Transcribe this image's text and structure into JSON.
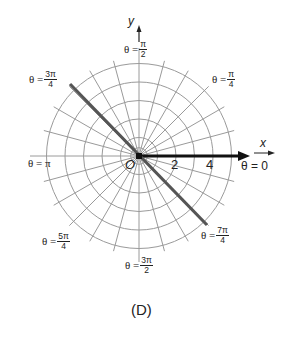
{
  "chart_data": {
    "type": "polar",
    "title": "",
    "caption": "(D)",
    "graph": "θ = 3π/4 (line through origin)",
    "rings": [
      1,
      2,
      3,
      4,
      5
    ],
    "spoke_step_deg": 15,
    "radial_tick_labels": [
      "2",
      "4"
    ],
    "origin_label": "O",
    "x_axis_label": "x",
    "y_axis_label": "y",
    "angle_labels": [
      {
        "name": "theta-0",
        "text": "θ = 0"
      },
      {
        "name": "theta-pi-4",
        "num": "π",
        "den": "4"
      },
      {
        "name": "theta-pi-2",
        "num": "π",
        "den": "2"
      },
      {
        "name": "theta-3pi-4",
        "num": "3π",
        "den": "4"
      },
      {
        "name": "theta-pi",
        "text": "θ = π"
      },
      {
        "name": "theta-5pi-4",
        "num": "5π",
        "den": "4"
      },
      {
        "name": "theta-3pi-2",
        "num": "3π",
        "den": "2"
      },
      {
        "name": "theta-7pi-4",
        "num": "7π",
        "den": "4"
      }
    ],
    "highlighted_line": {
      "angle": "3π/4",
      "from_angle_deg": 135,
      "to_angle_deg": 315
    },
    "colors": {
      "grid": "#9a9a9a",
      "axis": "#111111",
      "line": "#555555",
      "text": "#222222"
    }
  },
  "labels": {
    "theta_prefix": "θ =",
    "theta_0": "θ = 0",
    "theta_pi": "θ = π",
    "pi4_num": "π",
    "pi4_den": "4",
    "pi2_num": "π",
    "pi2_den": "2",
    "3pi4_num": "3π",
    "3pi4_den": "4",
    "5pi4_num": "5π",
    "5pi4_den": "4",
    "3pi2_num": "3π",
    "3pi2_den": "2",
    "7pi4_num": "7π",
    "7pi4_den": "4",
    "tick_2": "2",
    "tick_4": "4",
    "origin": "O",
    "x": "x",
    "y": "y",
    "caption": "(D)"
  }
}
